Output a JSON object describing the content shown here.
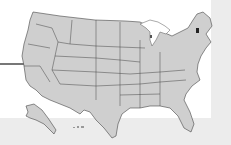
{
  "map": {
    "title": "United States",
    "region": "USA states outline",
    "fill_color": "#cfcfcf",
    "stroke_color": "#444444",
    "highlight_color": "#222222",
    "highlighted_states": [
      "Vermont"
    ],
    "background": {
      "main": "#ffffff",
      "strip": "#ececec"
    }
  }
}
